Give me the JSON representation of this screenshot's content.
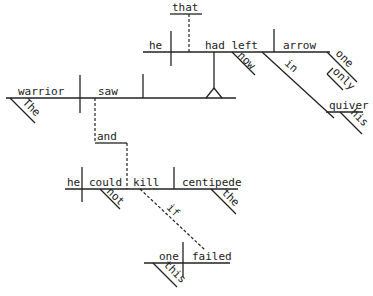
{
  "diagram": {
    "type": "sentence-diagram",
    "sentence": "The warrior saw that he had now left only one arrow in his quiver and he could not kill the centipede if this one failed",
    "words": {
      "warrior": "warrior",
      "the_1": "The",
      "saw": "saw",
      "that": "that",
      "he_1": "he",
      "had_left": "had left",
      "now": "now",
      "arrow": "arrow",
      "one_1": "one",
      "only": "only",
      "in": "in",
      "quiver": "quiver",
      "his": "his",
      "and": "and",
      "he_2": "he",
      "could": "could",
      "not": "not",
      "kill": "kill",
      "centipede": "centipede",
      "the_2": "the",
      "if": "if",
      "one_2": "one",
      "this": "this",
      "failed": "failed"
    }
  }
}
